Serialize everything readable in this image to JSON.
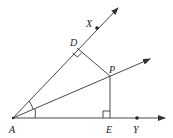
{
  "diagram": {
    "points": {
      "A": {
        "label": "A",
        "x": 13,
        "y": 118
      },
      "D": {
        "label": "D",
        "x": 77,
        "y": 48
      },
      "P": {
        "label": "P",
        "x": 110,
        "y": 76
      },
      "E": {
        "label": "E",
        "x": 110,
        "y": 118
      },
      "X": {
        "label": "X",
        "x": 97,
        "y": 28
      },
      "Y": {
        "label": "Y",
        "x": 137,
        "y": 118
      }
    },
    "rays": [
      "AX",
      "AY",
      "AP"
    ],
    "segments": [
      "PD",
      "PE"
    ],
    "right_angles": [
      "ADP",
      "AEP"
    ],
    "angle_marks": [
      "XAP",
      "PAY"
    ],
    "colors": {
      "stroke": "#333333",
      "text": "#222222",
      "background": "#ffffff"
    }
  }
}
